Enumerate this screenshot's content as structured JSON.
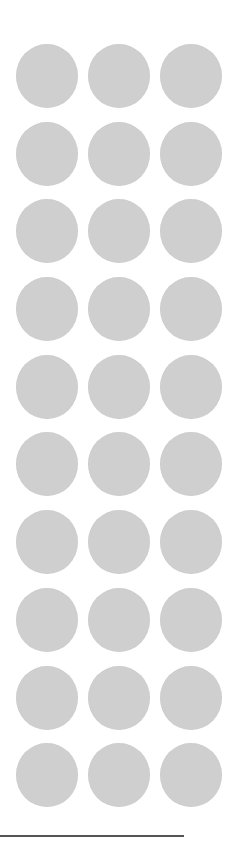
{
  "placeholders": {
    "rows": 10,
    "columns": 3,
    "shape": "circle",
    "color": "#cfcfcf",
    "items": [
      {
        "row": 1,
        "col": 1
      },
      {
        "row": 1,
        "col": 2
      },
      {
        "row": 1,
        "col": 3
      },
      {
        "row": 2,
        "col": 1
      },
      {
        "row": 2,
        "col": 2
      },
      {
        "row": 2,
        "col": 3
      },
      {
        "row": 3,
        "col": 1
      },
      {
        "row": 3,
        "col": 2
      },
      {
        "row": 3,
        "col": 3
      },
      {
        "row": 4,
        "col": 1
      },
      {
        "row": 4,
        "col": 2
      },
      {
        "row": 4,
        "col": 3
      },
      {
        "row": 5,
        "col": 1
      },
      {
        "row": 5,
        "col": 2
      },
      {
        "row": 5,
        "col": 3
      },
      {
        "row": 6,
        "col": 1
      },
      {
        "row": 6,
        "col": 2
      },
      {
        "row": 6,
        "col": 3
      },
      {
        "row": 7,
        "col": 1
      },
      {
        "row": 7,
        "col": 2
      },
      {
        "row": 7,
        "col": 3
      },
      {
        "row": 8,
        "col": 1
      },
      {
        "row": 8,
        "col": 2
      },
      {
        "row": 8,
        "col": 3
      },
      {
        "row": 9,
        "col": 1
      },
      {
        "row": 9,
        "col": 2
      },
      {
        "row": 9,
        "col": 3
      },
      {
        "row": 10,
        "col": 1
      },
      {
        "row": 10,
        "col": 2
      },
      {
        "row": 10,
        "col": 3
      }
    ]
  },
  "divider": {
    "color": "#555555"
  }
}
